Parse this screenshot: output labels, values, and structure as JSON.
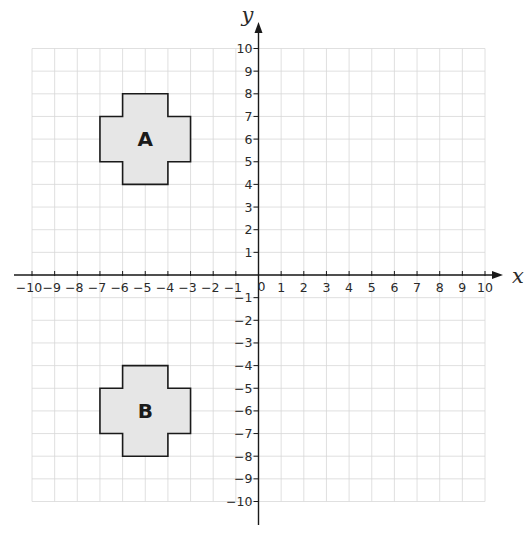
{
  "diagram": {
    "type": "coordinate-grid",
    "x_axis": {
      "label": "x",
      "min": -10,
      "max": 10,
      "ticks": [
        -10,
        -9,
        -8,
        -7,
        -6,
        -5,
        -4,
        -3,
        -2,
        -1,
        1,
        2,
        3,
        4,
        5,
        6,
        7,
        8,
        9,
        10
      ]
    },
    "y_axis": {
      "label": "y",
      "min": -10,
      "max": 10,
      "ticks": [
        -10,
        -9,
        -8,
        -7,
        -6,
        -5,
        -4,
        -3,
        -2,
        -1,
        1,
        2,
        3,
        4,
        5,
        6,
        7,
        8,
        9,
        10
      ]
    },
    "origin_label": "0",
    "minus_sign": "−",
    "colors": {
      "grid": "#d8d8d8",
      "axis": "#1a1a1a",
      "shape_fill": "#e6e6e6"
    },
    "shapes": [
      {
        "name": "A",
        "label": "A",
        "label_position": [
          -5,
          6
        ],
        "vertices": [
          [
            -6,
            8
          ],
          [
            -4,
            8
          ],
          [
            -4,
            7
          ],
          [
            -3,
            7
          ],
          [
            -3,
            5
          ],
          [
            -4,
            5
          ],
          [
            -4,
            4
          ],
          [
            -6,
            4
          ],
          [
            -6,
            5
          ],
          [
            -7,
            5
          ],
          [
            -7,
            7
          ],
          [
            -6,
            7
          ]
        ]
      },
      {
        "name": "B",
        "label": "B",
        "label_position": [
          -5,
          -6
        ],
        "vertices": [
          [
            -6,
            -4
          ],
          [
            -4,
            -4
          ],
          [
            -4,
            -5
          ],
          [
            -3,
            -5
          ],
          [
            -3,
            -7
          ],
          [
            -4,
            -7
          ],
          [
            -4,
            -8
          ],
          [
            -6,
            -8
          ],
          [
            -6,
            -7
          ],
          [
            -7,
            -7
          ],
          [
            -7,
            -5
          ],
          [
            -6,
            -5
          ]
        ]
      }
    ]
  }
}
